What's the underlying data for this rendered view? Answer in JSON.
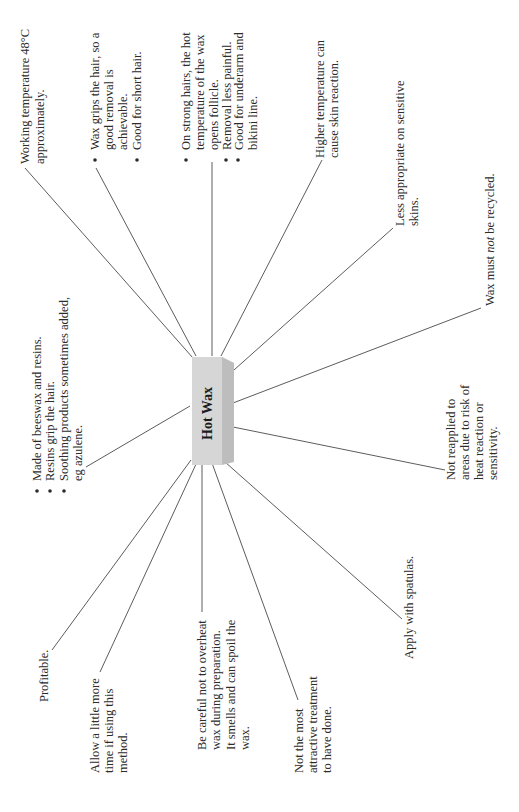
{
  "diagram": {
    "type": "mind-map",
    "orientation": "rotated-90-ccw",
    "center": {
      "label": "Hot Wax",
      "fill": "#d9d9d9",
      "side_fill": "#bdbdbd",
      "top_fill": "#e8e8e8"
    },
    "nodes": [
      {
        "id": "working-temp",
        "lines": [
          "Working temperature 48°C",
          "approximately."
        ],
        "bulleted": false
      },
      {
        "id": "wax-grips",
        "lines": [
          "Wax grips the hair, so a",
          "good removal is",
          "achievable.",
          "Good for short hair."
        ],
        "bullets_at": [
          0,
          3
        ]
      },
      {
        "id": "strong-hairs",
        "lines": [
          "On strong hairs, the hot",
          "temperature of the wax",
          "opens follicle.",
          "Removal less painful.",
          "Good for underarm and",
          "bikini line."
        ],
        "bullets_at": [
          0,
          3,
          4
        ]
      },
      {
        "id": "higher-temp",
        "lines": [
          "Higher temperature can",
          "cause skin reaction."
        ],
        "bulleted": false
      },
      {
        "id": "sensitive",
        "lines": [
          "Less appropriate on sensitive",
          "skins."
        ],
        "bulleted": false
      },
      {
        "id": "not-recycled",
        "lines": [
          "Wax must not be recycled."
        ],
        "italic_word": "not",
        "bulleted": false
      },
      {
        "id": "not-reapplied",
        "lines": [
          "Not reapplied to",
          "areas due to risk of",
          "heat reaction or",
          "sensitivity."
        ],
        "bulleted": false
      },
      {
        "id": "made-of",
        "lines": [
          "Made of beeswax and resins.",
          "Resins grip the hair.",
          "Soothing products sometimes added,",
          "eg azulene."
        ],
        "bullets_at": [
          0,
          1,
          2
        ]
      },
      {
        "id": "profitable",
        "lines": [
          "Profitable."
        ],
        "bulleted": false
      },
      {
        "id": "allow-time",
        "lines": [
          "Allow a little more",
          "time if using this",
          "method."
        ],
        "bulleted": false
      },
      {
        "id": "be-careful",
        "lines": [
          "Be careful not to overheat",
          "wax during preparation.",
          "It smells and can spoil the",
          "wax."
        ],
        "bulleted": false
      },
      {
        "id": "not-attractive",
        "lines": [
          "Not the most",
          "attractive treatment",
          "to have done."
        ],
        "bulleted": false
      },
      {
        "id": "spatulas",
        "lines": [
          "Apply with spatulas."
        ],
        "bulleted": false
      }
    ],
    "labels": {
      "center": "Hot Wax",
      "working_temp_1": "Working temperature 48°C",
      "working_temp_2": "approximately.",
      "wax_grips_1": "Wax grips the hair, so a",
      "wax_grips_2": "good removal is",
      "wax_grips_3": "achievable.",
      "wax_grips_4": "Good for short hair.",
      "strong_1": "On strong hairs, the hot",
      "strong_2": "temperature of the wax",
      "strong_3": "opens follicle.",
      "strong_4": "Removal less painful.",
      "strong_5": "Good for underarm and",
      "strong_6": "bikini line.",
      "higher_1": "Higher temperature can",
      "higher_2": "cause skin reaction.",
      "sensitive_1": "Less appropriate on sensitive",
      "sensitive_2": "skins.",
      "recycled_a": "Wax must ",
      "recycled_b": "not",
      "recycled_c": " be recycled.",
      "reapplied_1": "Not reapplied to",
      "reapplied_2": "areas due to risk of",
      "reapplied_3": "heat reaction or",
      "reapplied_4": "sensitivity.",
      "made_1": "Made of beeswax and resins.",
      "made_2": "Resins grip the hair.",
      "made_3": "Soothing products sometimes added,",
      "made_4": "eg azulene.",
      "profitable": "Profitable.",
      "allow_1": "Allow a little more",
      "allow_2": "time if using this",
      "allow_3": "method.",
      "careful_1": "Be careful not to overheat",
      "careful_2": "wax during preparation.",
      "careful_3": "It smells and can spoil the",
      "careful_4": "wax.",
      "attractive_1": "Not the most",
      "attractive_2": "attractive treatment",
      "attractive_3": "to have done.",
      "spatulas": "Apply with spatulas."
    }
  }
}
